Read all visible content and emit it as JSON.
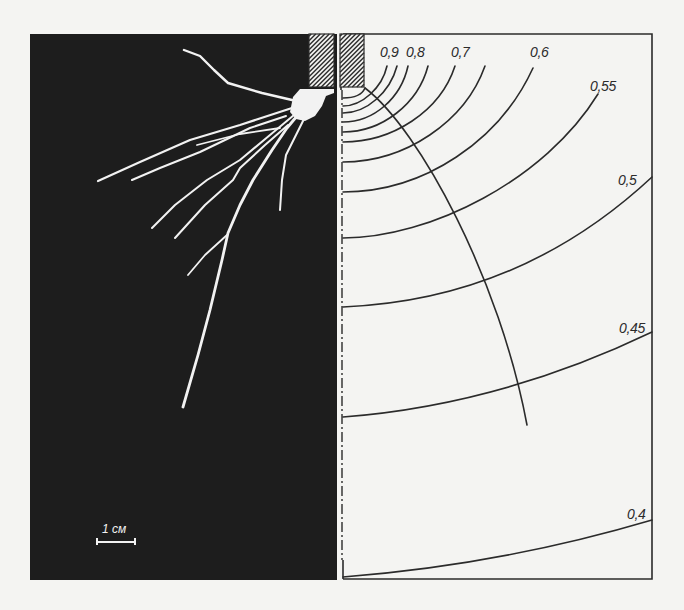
{
  "figure": {
    "scale_bar": {
      "label": "1 см"
    },
    "contour_labels": [
      "0,9",
      "0,8",
      "0,7",
      "0,6",
      "0,55",
      "0,5",
      "0,45",
      "0,4"
    ],
    "colors": {
      "background": "#f4f4f2",
      "root_panel": "#1d1d1d",
      "roots": "#f2f2f2",
      "lines": "#2b2b2b"
    }
  }
}
